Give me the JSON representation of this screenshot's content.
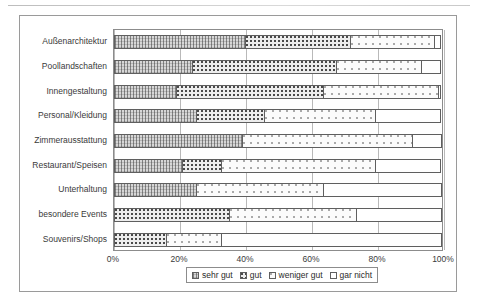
{
  "chart_data": {
    "type": "bar",
    "orientation": "horizontal",
    "stacked": true,
    "normalized": "percent",
    "title": "",
    "subtitle": "",
    "xlabel": "",
    "ylabel": "",
    "xlim": [
      0,
      100
    ],
    "xticks": [
      "0%",
      "20%",
      "40%",
      "60%",
      "80%",
      "100%"
    ],
    "xtick_values": [
      0,
      20,
      40,
      60,
      80,
      100
    ],
    "grid": true,
    "grid_axis": "x",
    "legend_position": "bottom",
    "categories": [
      "Außenarchitektur",
      "Poollandschaften",
      "Innengestaltung",
      "Personal/Kleidung",
      "Zimmerausstattung",
      "Restaurant/Speisen",
      "Unterhaltung",
      "besondere Events",
      "Souvenirs/Shops"
    ],
    "series": [
      {
        "name": "sehr gut",
        "pattern": "dense-hatch",
        "values": [
          40,
          24,
          19,
          25,
          39,
          21,
          25,
          0,
          0
        ]
      },
      {
        "name": "gut",
        "pattern": "checker-dot",
        "values": [
          32,
          44,
          45,
          21,
          0,
          12,
          0,
          35,
          16
        ]
      },
      {
        "name": "weniger gut",
        "pattern": "sparse-dot",
        "values": [
          26,
          26,
          35,
          34,
          52,
          47,
          39,
          39,
          17
        ]
      },
      {
        "name": "gar nicht",
        "pattern": "plain-white",
        "values": [
          2,
          6,
          1,
          20,
          9,
          20,
          36,
          26,
          67
        ]
      }
    ],
    "boundaries": [
      [
        40,
        72,
        98,
        100
      ],
      [
        24,
        68,
        94,
        100
      ],
      [
        19,
        64,
        99,
        100
      ],
      [
        25,
        46,
        80,
        100
      ],
      [
        39,
        39,
        91,
        100
      ],
      [
        21,
        33,
        80,
        100
      ],
      [
        25,
        25,
        64,
        100
      ],
      [
        0,
        11,
        35,
        74
      ],
      [
        0,
        4,
        16,
        33
      ]
    ]
  },
  "legend": {
    "items": [
      {
        "label": "sehr gut"
      },
      {
        "label": "gut"
      },
      {
        "label": "weniger gut"
      },
      {
        "label": "gar nicht"
      }
    ]
  }
}
